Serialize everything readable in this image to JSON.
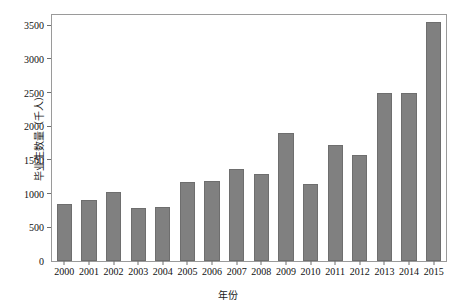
{
  "chart_data": {
    "type": "bar",
    "title": "",
    "xlabel": "年份",
    "ylabel": "毕业生数量（千人）",
    "categories": [
      "2000",
      "2001",
      "2002",
      "2003",
      "2004",
      "2005",
      "2006",
      "2007",
      "2008",
      "2009",
      "2010",
      "2011",
      "2012",
      "2013",
      "2014",
      "2015"
    ],
    "values": [
      850,
      900,
      1030,
      790,
      800,
      1170,
      1190,
      1370,
      1290,
      1900,
      1150,
      1720,
      1580,
      2500,
      2500,
      3550
    ],
    "ylim": [
      0,
      3650
    ],
    "yticks": [
      0,
      500,
      1000,
      1500,
      2000,
      2500,
      3000,
      3500
    ],
    "ytick_labels": [
      "0",
      "500",
      "1000",
      "1500",
      "2000",
      "2500",
      "3000",
      "3500"
    ],
    "grid": false,
    "legend": null,
    "bar_color": "#808080",
    "bar_edge_color": "#6e6e6e",
    "frame_color": "#9a9a9a",
    "background": "#ffffff"
  }
}
